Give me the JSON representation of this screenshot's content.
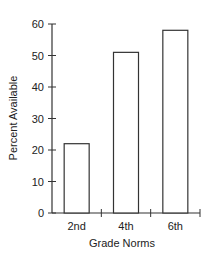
{
  "chart_data": {
    "type": "bar",
    "title": "",
    "xlabel": "Grade Norms",
    "ylabel": "Percent Available",
    "categories": [
      "2nd",
      "4th",
      "6th"
    ],
    "values": [
      22,
      51,
      58
    ],
    "ylim": [
      0,
      60
    ],
    "yticks": [
      0,
      10,
      20,
      30,
      40,
      50,
      60
    ],
    "grid": false,
    "legend": null,
    "bar_fill": "#ffffff",
    "bar_stroke": "#333333"
  }
}
